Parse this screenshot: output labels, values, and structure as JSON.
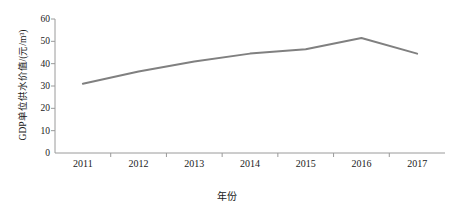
{
  "chart_data": {
    "type": "line",
    "title": "",
    "xlabel": "年份",
    "ylabel": "GDP单位供水价值/(元/m³)",
    "categories": [
      "2011",
      "2012",
      "2013",
      "2014",
      "2015",
      "2016",
      "2017"
    ],
    "values": [
      31.0,
      36.5,
      41.0,
      44.5,
      46.5,
      51.5,
      44.5
    ],
    "series": [
      {
        "name": "GDP单位供水价值",
        "values": [
          31.0,
          36.5,
          41.0,
          44.5,
          46.5,
          51.5,
          44.5
        ],
        "color": "#808080"
      }
    ],
    "ylim": [
      0,
      60
    ],
    "yticks": [
      0,
      10,
      20,
      30,
      40,
      50,
      60
    ],
    "ytick_labels": [
      "0",
      "10",
      "20",
      "30",
      "40",
      "50",
      "60"
    ],
    "grid": false,
    "legend": false,
    "legend_position": "none",
    "line_color": "#808080",
    "line_width": 2,
    "markers": false,
    "axis_color": "#9a9a9a",
    "background": "#ffffff"
  }
}
